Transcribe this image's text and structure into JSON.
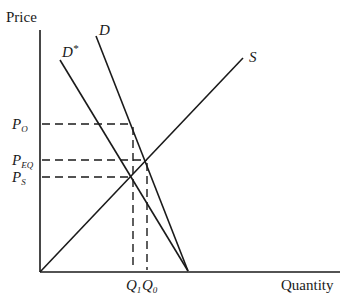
{
  "diagram": {
    "type": "supply-demand",
    "axes": {
      "y_label": "Price",
      "x_label": "Quantity",
      "origin": [
        40,
        272
      ],
      "y_top": [
        40,
        30
      ],
      "x_right": [
        340,
        272
      ]
    },
    "curves": [
      {
        "id": "S",
        "label": "S",
        "from": [
          40,
          272
        ],
        "to": [
          243,
          58
        ]
      },
      {
        "id": "D",
        "label": "D",
        "from": [
          96,
          36
        ],
        "to": [
          188,
          271
        ]
      },
      {
        "id": "D-star",
        "label": "D*",
        "from": [
          60,
          60
        ],
        "to": [
          188,
          271
        ]
      }
    ],
    "price_levels": [
      {
        "label_main": "P",
        "label_sub": "O",
        "y": 124,
        "x_end": 133
      },
      {
        "label_main": "P",
        "label_sub": "EQ",
        "y": 160,
        "x_end": 147
      },
      {
        "label_main": "P",
        "label_sub": "S",
        "y": 177,
        "x_end": 133
      }
    ],
    "quantity_levels": [
      {
        "label_main": "Q",
        "label_sub": "1",
        "x": 133,
        "y_top": 124
      },
      {
        "label_main": "Q",
        "label_sub": "0",
        "x": 147,
        "y_top": 160
      }
    ],
    "curve_labels": {
      "S": "S",
      "D": "D",
      "D_star_main": "D",
      "D_star_sup": "*"
    },
    "colors": {
      "line": "#1a1a1a",
      "background": "#ffffff"
    }
  }
}
